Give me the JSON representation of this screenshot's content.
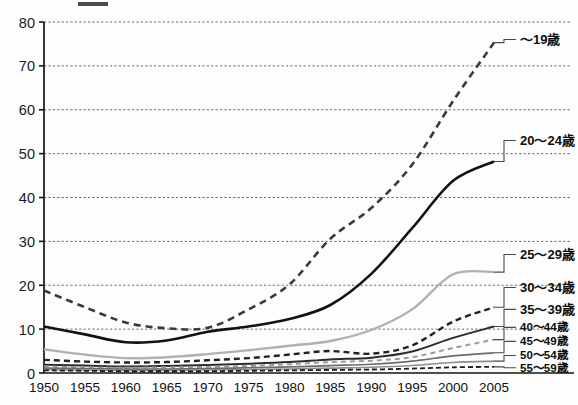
{
  "page": {
    "title_stub": "",
    "background": "#fdfdfd"
  },
  "chart_data": {
    "type": "line",
    "title": "",
    "subtitle": "",
    "xlabel": "",
    "ylabel": "",
    "xlim": [
      1950,
      2005
    ],
    "ylim": [
      0,
      80
    ],
    "grid": true,
    "legend_position": "right",
    "x": [
      1950,
      1955,
      1960,
      1965,
      1970,
      1975,
      1980,
      1985,
      1990,
      1995,
      2000,
      2005
    ],
    "ytick_labels": [
      "0",
      "10",
      "20",
      "30",
      "40",
      "50",
      "60",
      "70",
      "80"
    ],
    "ytick_values": [
      0,
      10,
      20,
      30,
      40,
      50,
      60,
      70,
      80
    ],
    "xtick_labels": [
      "1950",
      "1955",
      "1960",
      "1965",
      "1970",
      "1975",
      "1980",
      "1985",
      "1990",
      "1995",
      "2000",
      "2005"
    ],
    "series": [
      {
        "name": "~19歳",
        "label": "～19歳",
        "style": "dashed",
        "color": "#3a3a3a",
        "width": 2.6,
        "dash": "7 5",
        "values": [
          18.8,
          15.0,
          11.5,
          10.2,
          10.3,
          14.5,
          20.2,
          30.6,
          37.6,
          47.5,
          62.0,
          75.3
        ],
        "legend_y": 76
      },
      {
        "name": "20-24歳",
        "label": "20～24歳",
        "style": "solid",
        "color": "#121212",
        "width": 2.6,
        "dash": "",
        "values": [
          10.6,
          8.8,
          7.0,
          7.4,
          9.4,
          10.6,
          12.3,
          15.5,
          22.6,
          33.0,
          43.8,
          48.2
        ],
        "legend_y": 53
      },
      {
        "name": "25-29歳",
        "label": "25～29歳",
        "style": "solid",
        "color": "#b0b0b0",
        "width": 2.4,
        "dash": "",
        "values": [
          5.4,
          4.2,
          3.4,
          3.6,
          4.3,
          5.2,
          6.2,
          7.3,
          9.8,
          14.5,
          22.5,
          23.0
        ],
        "legend_y": 27
      },
      {
        "name": "30-34歳",
        "label": "30～34歳",
        "style": "dashed",
        "color": "#222222",
        "width": 2.4,
        "dash": "6 4",
        "values": [
          3.0,
          2.6,
          2.4,
          2.5,
          2.9,
          3.4,
          4.2,
          5.0,
          4.4,
          6.3,
          11.7,
          15.0
        ],
        "legend_y": 19.5
      },
      {
        "name": "35-39歳",
        "label": "35～39歳",
        "style": "solid",
        "color": "#2b2b2b",
        "width": 2.0,
        "dash": "",
        "values": [
          1.9,
          1.7,
          1.5,
          1.6,
          1.8,
          2.1,
          2.5,
          3.1,
          3.5,
          4.9,
          8.0,
          10.6
        ],
        "legend_y": 14.5
      },
      {
        "name": "40-44歳",
        "label": "40～44歳",
        "style": "dashed",
        "color": "#9a9a9a",
        "width": 2.0,
        "dash": "5 4",
        "values": [
          1.5,
          1.3,
          1.2,
          1.3,
          1.4,
          1.6,
          2.0,
          2.5,
          2.8,
          3.6,
          5.7,
          7.6
        ],
        "legend_y": 10.4
      },
      {
        "name": "45-49歳",
        "label": "45～49歳",
        "style": "solid",
        "color": "#6b6b6b",
        "width": 1.7,
        "dash": "",
        "values": [
          1.1,
          1.0,
          0.9,
          0.9,
          1.0,
          1.2,
          1.4,
          1.7,
          2.0,
          2.7,
          3.9,
          4.6
        ],
        "legend_y": 7.2
      },
      {
        "name": "50-54歳",
        "label": "50～54歳",
        "style": "solid",
        "color": "#8d8d8d",
        "width": 1.6,
        "dash": "",
        "values": [
          0.8,
          0.7,
          0.6,
          0.6,
          0.7,
          0.8,
          0.9,
          1.1,
          1.3,
          1.7,
          2.4,
          2.7
        ],
        "legend_y": 4.0
      },
      {
        "name": "55-59歳",
        "label": "55～59歳",
        "style": "dashed",
        "color": "#1c1c1c",
        "width": 1.8,
        "dash": "5 3",
        "values": [
          0.6,
          0.5,
          0.4,
          0.4,
          0.4,
          0.5,
          0.6,
          0.7,
          0.8,
          1.0,
          1.3,
          1.4
        ],
        "legend_y": 1.2
      }
    ]
  }
}
